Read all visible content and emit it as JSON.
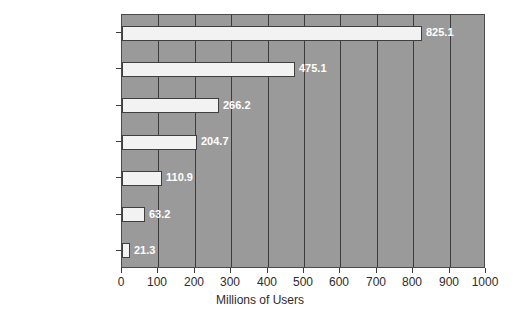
{
  "chart_data": {
    "type": "bar",
    "orientation": "horizontal",
    "title": "",
    "xlabel": "Millions of Users",
    "ylabel": "",
    "categories": [
      "Asia",
      "Europe",
      "North America",
      "Latin America",
      "Africa",
      "Middle East",
      "Australia/Oceania"
    ],
    "values": [
      825.1,
      475.1,
      266.2,
      204.7,
      110.9,
      63.2,
      21.3
    ],
    "value_labels": [
      "825.1",
      "475.1",
      "266.2",
      "204.7",
      "110.9",
      "63.2",
      "21.3"
    ],
    "xlim": [
      0,
      1000
    ],
    "xticks": [
      0,
      100,
      200,
      300,
      400,
      500,
      600,
      700,
      800,
      900,
      1000
    ],
    "xtick_labels": [
      "0",
      "100",
      "200",
      "300",
      "400",
      "500",
      "600",
      "700",
      "800",
      "900",
      "1000"
    ],
    "grid": true,
    "grid_axis": "x",
    "legend": false,
    "colors": {
      "plot_background": "#9a9a9a",
      "figure_background": "#ffffff",
      "bar_fill": "#f2f2f2",
      "bar_edge": "#3f3f3f",
      "gridline": "#3c3c3c",
      "value_label_text": "#ffffff",
      "axis_text": "#2b2b2b"
    }
  }
}
